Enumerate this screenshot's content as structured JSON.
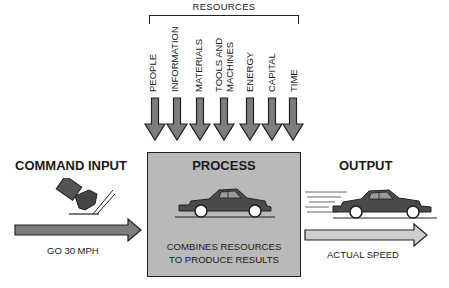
{
  "resources": {
    "title": "RESOURCES",
    "items": [
      {
        "label": "PEOPLE"
      },
      {
        "label": "INFORMATION"
      },
      {
        "label": "MATERIALS"
      },
      {
        "label": "TOOLS AND",
        "label2": "MACHINES"
      },
      {
        "label": "ENERGY"
      },
      {
        "label": "CAPITAL"
      },
      {
        "label": "TIME"
      }
    ]
  },
  "command_input": {
    "title": "COMMAND INPUT",
    "arrow_label": "GO 30 MPH",
    "icon": "foot-on-pedal-icon"
  },
  "process": {
    "title": "PROCESS",
    "description_line1": "COMBINES RESOURCES",
    "description_line2": "TO PRODUCE RESULTS",
    "icon": "car-icon"
  },
  "output": {
    "title": "OUTPUT",
    "arrow_label": "ACTUAL SPEED",
    "icon": "moving-car-icon"
  },
  "colors": {
    "arrow_fill": "#7d7d7d",
    "output_arrow_fill": "#cfcfcf",
    "process_fill": "#b9b9b9",
    "car_fill": "#4a4a4a",
    "stroke": "#222222"
  }
}
